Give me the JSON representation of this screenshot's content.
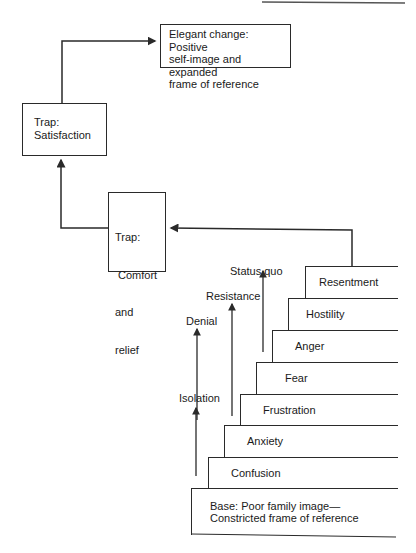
{
  "diagram": {
    "type": "staircase-flow",
    "boxes": {
      "elegant_change": "Elegant change: Positive self-image and expanded frame of reference",
      "elegant_lines": [
        "Elegant change: Positive",
        "self-image and expanded",
        "frame of reference"
      ],
      "trap_satisfaction_lines": [
        "Trap:",
        "Satisfaction"
      ],
      "trap_comfort_lines": [
        "Trap:",
        " Comfort",
        "and",
        "relief"
      ]
    },
    "steps": [
      {
        "label": "Resentment"
      },
      {
        "label": "Hostility"
      },
      {
        "label": "Anger"
      },
      {
        "label": "Fear"
      },
      {
        "label": "Frustration"
      },
      {
        "label": "Anxiety"
      },
      {
        "label": "Confusion"
      }
    ],
    "base_lines": [
      "Base: Poor family image—",
      "Constricted frame of reference"
    ],
    "arrow_labels": {
      "status_quo": "Status quo",
      "resistance": "Resistance",
      "denial": "Denial",
      "isolation": "Isolation"
    },
    "colors": {
      "line": "#2a2a2a",
      "background": "#ffffff"
    }
  }
}
